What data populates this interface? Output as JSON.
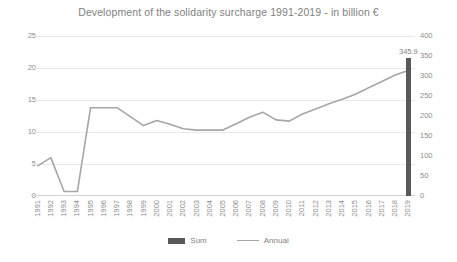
{
  "chart_data": {
    "type": "line",
    "title": "Development of the solidarity surcharge 1991-2019 - in billion €",
    "xlabel": "",
    "ylabel": "",
    "grid": true,
    "legend_position": "bottom",
    "categories": [
      "1991",
      "1992",
      "1993",
      "1994",
      "1995",
      "1996",
      "1997",
      "1998",
      "1999",
      "2000",
      "2001",
      "2002",
      "2003",
      "2004",
      "2005",
      "2006",
      "2007",
      "2008",
      "2009",
      "2010",
      "2011",
      "2012",
      "2013",
      "2014",
      "2015",
      "2016",
      "2017",
      "2018",
      "2019"
    ],
    "series": [
      {
        "name": "Annual",
        "type": "line",
        "axis": "left",
        "color": "#a6a6a6",
        "values": [
          4.7,
          6.0,
          0.7,
          0.7,
          13.8,
          13.8,
          13.8,
          12.4,
          11.0,
          11.8,
          11.2,
          10.5,
          10.3,
          10.3,
          10.3,
          11.3,
          12.3,
          13.1,
          11.9,
          11.7,
          12.8,
          13.6,
          14.4,
          15.1,
          15.9,
          16.9,
          17.9,
          18.9,
          19.6
        ]
      },
      {
        "name": "Sum",
        "type": "bar",
        "axis": "right",
        "color": "#595959",
        "category": "2019",
        "value": 345.9,
        "label": "345.9"
      }
    ],
    "y_left": {
      "min": 0,
      "max": 25,
      "ticks": [
        "0",
        "5",
        "10",
        "15",
        "20",
        "25"
      ]
    },
    "y_right": {
      "min": 0,
      "max": 400,
      "ticks": [
        "0",
        "50",
        "100",
        "150",
        "200",
        "250",
        "300",
        "350",
        "400"
      ]
    },
    "legend": [
      {
        "label": "Sum",
        "marker": "bar-swatch",
        "color": "#595959"
      },
      {
        "label": "Annual",
        "marker": "line-swatch",
        "color": "#a6a6a6"
      }
    ]
  }
}
